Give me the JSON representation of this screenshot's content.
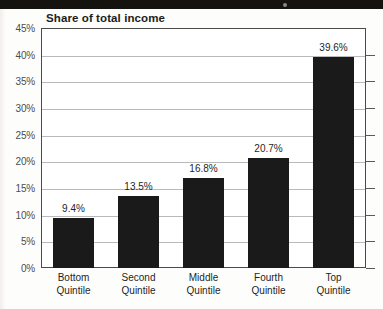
{
  "chart_data": {
    "type": "bar",
    "title": "Share of total income",
    "xlabel": "",
    "ylabel": "",
    "categories": [
      "Bottom Quintile",
      "Second Quintile",
      "Middle Quintile",
      "Fourth Quintile",
      "Top Quintile"
    ],
    "category_lines": [
      [
        "Bottom",
        "Quintile"
      ],
      [
        "Second",
        "Quintile"
      ],
      [
        "Middle",
        "Quintile"
      ],
      [
        "Fourth",
        "Quintile"
      ],
      [
        "Top",
        "Quintile"
      ]
    ],
    "values": [
      9.4,
      13.5,
      16.8,
      20.7,
      39.6
    ],
    "value_labels": [
      "9.4%",
      "13.5%",
      "16.8%",
      "20.7%",
      "39.6%"
    ],
    "ylim": [
      0,
      45
    ],
    "ytick_values": [
      0,
      5,
      10,
      15,
      20,
      25,
      30,
      35,
      40,
      45
    ],
    "ytick_labels": [
      "0%",
      "5%",
      "10%",
      "15%",
      "20%",
      "25%",
      "30%",
      "35%",
      "40%",
      "45%"
    ],
    "grid": true,
    "legend": "none",
    "bar_color": "#1a1a1a",
    "gridline_color": "#b9b9b9",
    "axis_color": "#4a4a4a",
    "background_color": "#ffffff"
  }
}
